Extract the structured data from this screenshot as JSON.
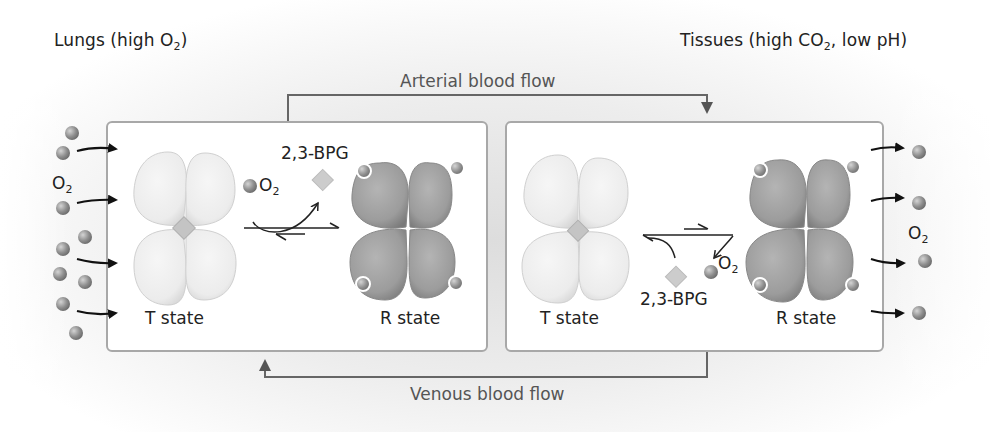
{
  "figure": {
    "left_region": {
      "label_main": "Lungs (high O",
      "label_sub": "2",
      "label_end": ")"
    },
    "right_region": {
      "label_main": "Tissues (high CO",
      "label_sub": "2",
      "label_end": ", low pH)"
    },
    "arterial_flow_label": "Arterial blood flow",
    "venous_flow_label": "Venous blood flow",
    "left_panel": {
      "o2_label_main": "O",
      "o2_label_sub": "2",
      "reaction_o2_main": "O",
      "reaction_o2_sub": "2",
      "bpg_label": "2,3-BPG",
      "t_state_label": "T state",
      "r_state_label": "R state",
      "free_o2_count": 12,
      "incoming_arrow_count": 4
    },
    "right_panel": {
      "o2_label_main": "O",
      "o2_label_sub": "2",
      "reaction_o2_main": "O",
      "reaction_o2_sub": "2",
      "bpg_label": "2,3-BPG",
      "t_state_label": "T state",
      "r_state_label": "R state",
      "released_o2_count": 4,
      "outgoing_arrow_count": 4
    },
    "colors": {
      "t_state_fill": "#ececec",
      "r_state_fill": "#9a9a9a",
      "bpg_fill": "#c8c8c8",
      "o2_fill": "#8c8c8c",
      "box_border": "#a8a8a8",
      "flow_line": "#666666",
      "arrow": "#111111"
    }
  }
}
